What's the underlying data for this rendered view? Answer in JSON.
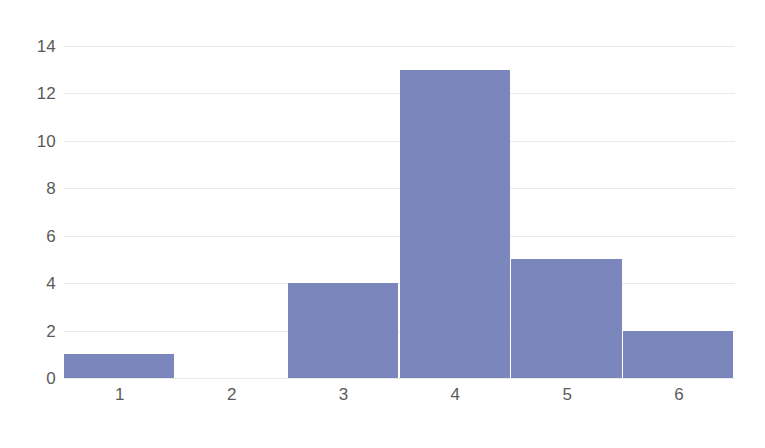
{
  "chart_data": {
    "type": "bar",
    "title": "",
    "subtitle": "",
    "xlabel": "",
    "ylabel": "",
    "categories": [
      "1",
      "2",
      "3",
      "4",
      "5",
      "6"
    ],
    "values": [
      1,
      0,
      4,
      13,
      5,
      2
    ],
    "series": [
      {
        "name": "",
        "values": [
          1,
          0,
          4,
          13,
          5,
          2
        ]
      }
    ],
    "xlim": [
      0.5,
      6.5
    ],
    "ylim": [
      0,
      14
    ],
    "ytick_labels": [
      "0",
      "2",
      "4",
      "6",
      "8",
      "10",
      "12",
      "14"
    ],
    "ytick_values": [
      0,
      2,
      4,
      6,
      8,
      10,
      12,
      14
    ],
    "xtick_labels": [
      "1",
      "2",
      "3",
      "4",
      "5",
      "6"
    ],
    "grid": "horizontal",
    "legend": "none",
    "bar_gap": "none",
    "colors": {
      "bar_fill": "#7b87bc",
      "bar_edge": "#ffffff",
      "gridline": "#e9e9e9",
      "tick_label": "#5a5a5a",
      "background": "#ffffff"
    }
  }
}
